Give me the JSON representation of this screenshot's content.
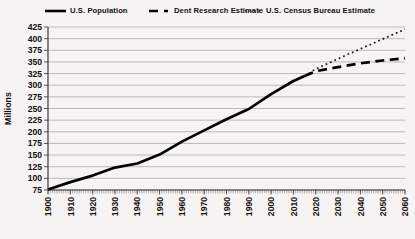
{
  "chart_data": {
    "type": "line",
    "title": "",
    "xlabel": "",
    "ylabel": "Millions",
    "ylim": [
      75,
      425
    ],
    "ytick_step": 25,
    "y_tick_labels": [
      "75",
      "100",
      "125",
      "150",
      "175",
      "200",
      "225",
      "250",
      "275",
      "300",
      "325",
      "350",
      "375",
      "400",
      "425"
    ],
    "xlim": [
      1900,
      2060
    ],
    "xtick_step": 10,
    "x_tick_labels": [
      "1900",
      "1910",
      "1920",
      "1930",
      "1940",
      "1950",
      "1960",
      "1970",
      "1980",
      "1990",
      "2000",
      "2010",
      "2020",
      "2030",
      "2040",
      "2050",
      "2060"
    ],
    "grid": "horizontal",
    "legend_position": "top",
    "series": [
      {
        "name": "U.S. Population",
        "line_style": "solid",
        "points": [
          [
            1900,
            76
          ],
          [
            1910,
            92
          ],
          [
            1920,
            106
          ],
          [
            1930,
            123
          ],
          [
            1940,
            132
          ],
          [
            1950,
            151
          ],
          [
            1960,
            179
          ],
          [
            1970,
            203
          ],
          [
            1980,
            227
          ],
          [
            1990,
            249
          ],
          [
            2000,
            281
          ],
          [
            2010,
            309
          ],
          [
            2015,
            320
          ]
        ]
      },
      {
        "name": "Dent Research Estimate",
        "line_style": "dashed",
        "points": [
          [
            2015,
            320
          ],
          [
            2020,
            330
          ],
          [
            2030,
            339
          ],
          [
            2040,
            347
          ],
          [
            2050,
            353
          ],
          [
            2060,
            358
          ]
        ]
      },
      {
        "name": "U.S. Census Bureau Estimate",
        "line_style": "dotted",
        "points": [
          [
            2015,
            320
          ],
          [
            2020,
            335
          ],
          [
            2030,
            357
          ],
          [
            2040,
            378
          ],
          [
            2050,
            399
          ],
          [
            2060,
            420
          ]
        ]
      }
    ],
    "colors": {
      "line": "#000000",
      "grid": "#b5b3b0",
      "axis": "#3a3a3a",
      "tick": "#555555",
      "background": "#f5f4f2",
      "text": "#111111"
    }
  }
}
